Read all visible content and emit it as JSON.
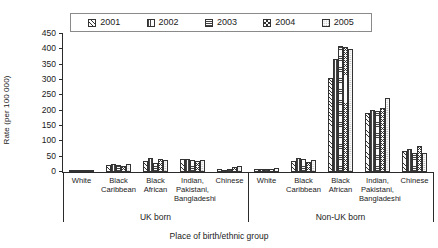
{
  "chart_data": {
    "type": "bar",
    "title": "",
    "xlabel": "Place of birth/ethnic group",
    "ylabel": "Rate (per 100 000)",
    "ylim": [
      0,
      450
    ],
    "ytick_values": [
      0,
      50,
      100,
      150,
      200,
      250,
      300,
      350,
      400,
      450
    ],
    "ytick_labels": [
      "0",
      "50",
      "100",
      "150",
      "200",
      "250",
      "300",
      "350",
      "400",
      "450"
    ],
    "grid": false,
    "legend_position": "top-center",
    "legend_entries": [
      "2001",
      "2002",
      "2003",
      "2004",
      "2005"
    ],
    "group_labels": [
      "UK born",
      "Non-UK born"
    ],
    "categories": [
      "White",
      "Black\nCaribbean",
      "Black\nAfrican",
      "Indian,\nPakistani,\nBangladeshi",
      "Chinese",
      "White",
      "Black\nCaribbean",
      "Black\nAfrican",
      "Indian,\nPakistani,\nBangladeshi",
      "Chinese"
    ],
    "series": [
      {
        "name": "2001",
        "pattern": "diagonal-hatch",
        "values": [
          2,
          23,
          35,
          43,
          11,
          9,
          37,
          306,
          193,
          70
        ]
      },
      {
        "name": "2002",
        "pattern": "vertical-hatch",
        "values": [
          2,
          25,
          47,
          44,
          7,
          10,
          46,
          368,
          202,
          75
        ]
      },
      {
        "name": "2003",
        "pattern": "horizontal-hatch",
        "values": [
          2,
          22,
          30,
          39,
          9,
          10,
          44,
          411,
          199,
          63
        ]
      },
      {
        "name": "2004",
        "pattern": "cross-hatch",
        "values": [
          2,
          20,
          43,
          36,
          15,
          9,
          33,
          409,
          209,
          85
        ]
      },
      {
        "name": "2005",
        "pattern": "dotted",
        "values": [
          2,
          26,
          40,
          39,
          19,
          12,
          38,
          402,
          240,
          62
        ]
      }
    ]
  }
}
